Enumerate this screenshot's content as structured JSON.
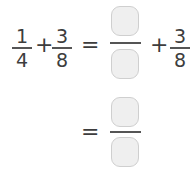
{
  "equation": {
    "line1": {
      "term1": {
        "numerator": "1",
        "denominator": "4"
      },
      "op1": "+",
      "term2": {
        "numerator": "3",
        "denominator": "8"
      },
      "equals": "=",
      "blank": {
        "numerator": "",
        "denominator": ""
      },
      "op2": "+",
      "term3": {
        "numerator": "3",
        "denominator": "8"
      }
    },
    "line2": {
      "equals": "=",
      "blank": {
        "numerator": "",
        "denominator": ""
      }
    }
  }
}
